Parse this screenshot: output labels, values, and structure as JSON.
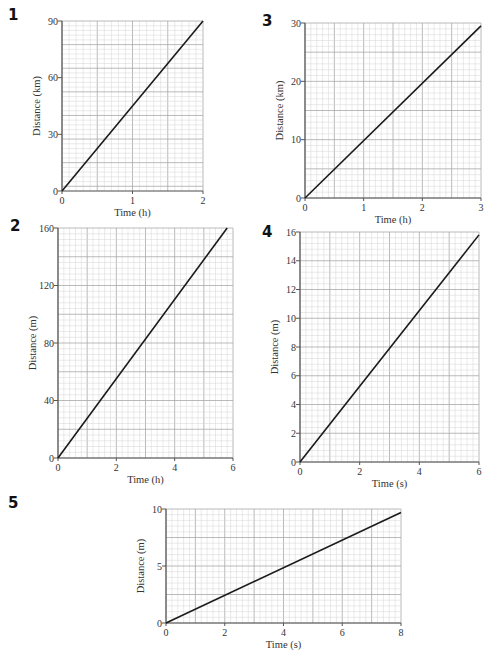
{
  "questions": [
    {
      "number": "1"
    },
    {
      "number": "2"
    },
    {
      "number": "3"
    },
    {
      "number": "4"
    },
    {
      "number": "5"
    }
  ],
  "chart_data": [
    {
      "id": "1",
      "type": "line",
      "title": "",
      "xlabel": "Time (h)",
      "ylabel": "Distance (km)",
      "xlim": [
        0,
        2
      ],
      "ylim": [
        0,
        90
      ],
      "xticks": [
        0,
        1,
        2
      ],
      "yticks": [
        0,
        30,
        60,
        90
      ],
      "grid": true,
      "series": [
        {
          "name": "distance",
          "x": [
            0,
            2
          ],
          "y": [
            0,
            90
          ]
        }
      ]
    },
    {
      "id": "2",
      "type": "line",
      "title": "",
      "xlabel": "Time (h)",
      "ylabel": "Distance (m)",
      "xlim": [
        0,
        6
      ],
      "ylim": [
        0,
        160
      ],
      "xticks": [
        0,
        2,
        4,
        6
      ],
      "yticks": [
        0,
        40,
        80,
        120,
        160
      ],
      "grid": true,
      "series": [
        {
          "name": "distance",
          "x": [
            0,
            5.8
          ],
          "y": [
            0,
            160
          ]
        }
      ]
    },
    {
      "id": "3",
      "type": "line",
      "title": "",
      "xlabel": "Time (h)",
      "ylabel": "Distance (km)",
      "xlim": [
        0,
        3
      ],
      "ylim": [
        0,
        30
      ],
      "xticks": [
        0,
        1,
        2,
        3
      ],
      "yticks": [
        0,
        10,
        20,
        30
      ],
      "grid": true,
      "series": [
        {
          "name": "distance",
          "x": [
            0,
            3
          ],
          "y": [
            0,
            29.5
          ]
        }
      ]
    },
    {
      "id": "4",
      "type": "line",
      "title": "",
      "xlabel": "Time (s)",
      "ylabel": "Distance (m)",
      "xlim": [
        0,
        6
      ],
      "ylim": [
        0,
        16
      ],
      "xticks": [
        0,
        2,
        4,
        6
      ],
      "yticks": [
        0,
        2,
        4,
        6,
        8,
        10,
        12,
        14,
        16
      ],
      "grid": true,
      "series": [
        {
          "name": "distance",
          "x": [
            0,
            6
          ],
          "y": [
            0,
            15.8
          ]
        }
      ]
    },
    {
      "id": "5",
      "type": "line",
      "title": "",
      "xlabel": "Time (s)",
      "ylabel": "Distance (m)",
      "xlim": [
        0,
        8
      ],
      "ylim": [
        0,
        10
      ],
      "xticks": [
        0,
        2,
        4,
        6,
        8
      ],
      "yticks": [
        0,
        5,
        10
      ],
      "grid": true,
      "series": [
        {
          "name": "distance",
          "x": [
            0,
            8
          ],
          "y": [
            0,
            9.7
          ]
        }
      ]
    }
  ],
  "layout": {
    "1": {
      "left": 62,
      "top": 21,
      "width": 141,
      "height": 170,
      "minor_x": 20,
      "minor_y": 36
    },
    "2": {
      "left": 58,
      "top": 228,
      "width": 175,
      "height": 230,
      "minor_x": 30,
      "minor_y": 40
    },
    "3": {
      "left": 305,
      "top": 23,
      "width": 176,
      "height": 175,
      "minor_x": 30,
      "minor_y": 30
    },
    "4": {
      "left": 300,
      "top": 232,
      "width": 179,
      "height": 230,
      "minor_x": 30,
      "minor_y": 40
    },
    "5": {
      "left": 166,
      "top": 509,
      "width": 235,
      "height": 114,
      "minor_x": 40,
      "minor_y": 20
    }
  },
  "colors": {
    "grid_minor": "#d4d4d4",
    "grid_major": "#a8a8a8",
    "axis": "#555555",
    "line": "#1a1a1a"
  }
}
